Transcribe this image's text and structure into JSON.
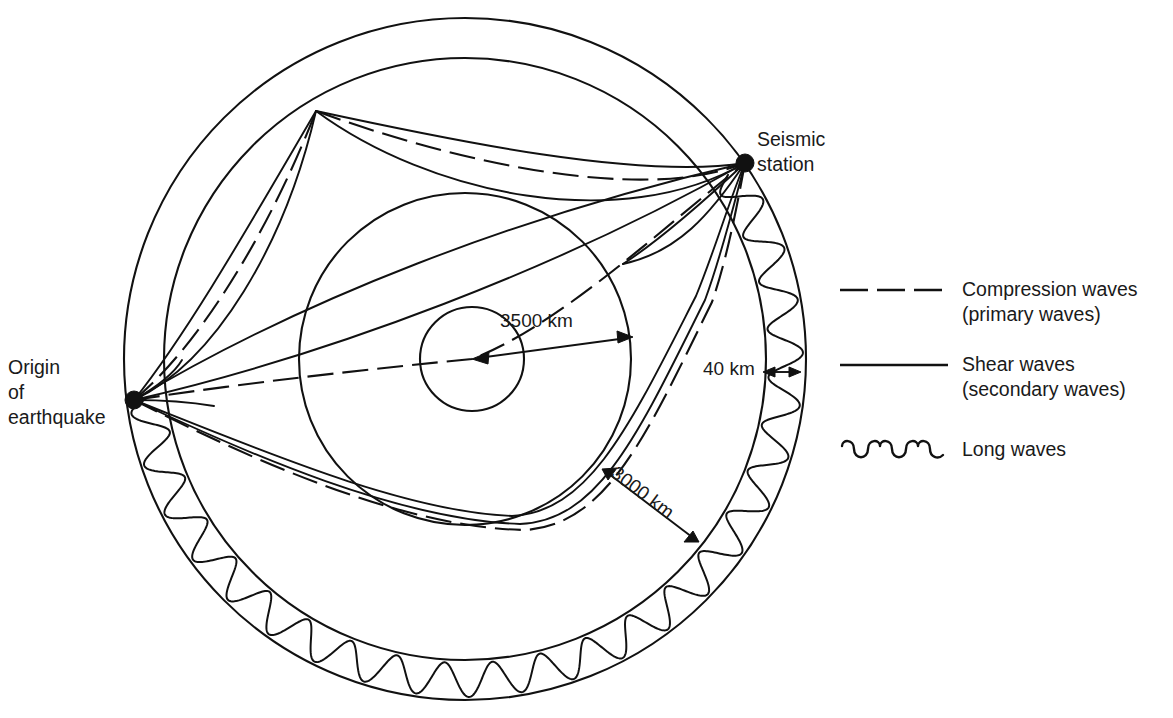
{
  "diagram": {
    "labels": {
      "origin": "Origin\nof\nearthquake",
      "station": "Seismic\nstation",
      "mantle_radius": "3500 km",
      "core_depth": "3000 km",
      "crust_thickness": "40 km"
    },
    "geometry": {
      "center_x": 465,
      "center_y": 359,
      "outer_radius": 341,
      "crust_inner_radius": 301,
      "mantle_radius": 166,
      "core_radius": 52,
      "origin_point": [
        134,
        400
      ],
      "station_point": [
        745,
        163
      ],
      "surface_bounce_point": [
        316,
        111
      ]
    },
    "colors": {
      "ink": "#111111",
      "background": "#ffffff"
    }
  },
  "legend": {
    "items": [
      {
        "symbol": "dashed-line",
        "label": "Compression waves\n(primary waves)"
      },
      {
        "symbol": "solid-line",
        "label": "Shear waves\n(secondary waves)"
      },
      {
        "symbol": "wavy-line",
        "label": "Long waves"
      }
    ]
  },
  "chart_data": {
    "type": "diagram",
    "annotations": [
      {
        "text": "3500 km",
        "meaning": "radius of the Earth's core region (mantle boundary)"
      },
      {
        "text": "3000 km",
        "meaning": "depth from surface to core boundary"
      },
      {
        "text": "40 km",
        "meaning": "thickness of the crust layer"
      }
    ],
    "nodes": [
      {
        "name": "Origin of earthquake",
        "x": 134,
        "y": 400
      },
      {
        "name": "Seismic station",
        "x": 745,
        "y": 163
      }
    ],
    "series": [
      {
        "name": "Compression waves (primary waves)",
        "style": "dashed"
      },
      {
        "name": "Shear waves (secondary waves)",
        "style": "solid"
      },
      {
        "name": "Long waves",
        "style": "wavy"
      }
    ]
  }
}
